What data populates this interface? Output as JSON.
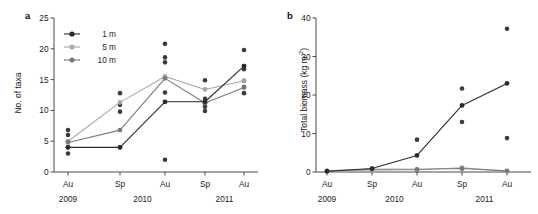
{
  "figure": {
    "panel_a_label": "a",
    "panel_b_label": "b"
  },
  "series_styles": {
    "1m": "#2b2b2b",
    "5m": "#a8a8a8",
    "10m": "#7a7a7a"
  },
  "legend": {
    "items": [
      {
        "label": "1 m",
        "color": "#2b2b2b"
      },
      {
        "label": "5 m",
        "color": "#a8a8a8"
      },
      {
        "label": "10 m",
        "color": "#7a7a7a"
      }
    ]
  },
  "chart_data": [
    {
      "type": "line",
      "panel": "a",
      "title": "",
      "xlabel": "",
      "ylabel": "No. of taxa",
      "ylim": [
        0,
        25
      ],
      "yticks": [
        0,
        5,
        10,
        15,
        20,
        25
      ],
      "ytick_labels": [
        "0",
        "5",
        "10",
        "15",
        "20",
        "25"
      ],
      "grid": false,
      "legend_position": "top-left",
      "categories": [
        "Au",
        "Sp",
        "Au",
        "Sp",
        "Au"
      ],
      "x_group_labels": [
        {
          "label": "2009",
          "spans": [
            0
          ]
        },
        {
          "label": "2010",
          "spans": [
            1,
            2
          ]
        },
        {
          "label": "2011",
          "spans": [
            3,
            4
          ]
        }
      ],
      "series": [
        {
          "name": "1 m",
          "color": "#2b2b2b",
          "values": [
            4.0,
            4.0,
            11.4,
            11.4,
            17.2
          ]
        },
        {
          "name": "5 m",
          "color": "#a8a8a8",
          "values": [
            5.0,
            11.3,
            15.5,
            13.4,
            14.8
          ]
        },
        {
          "name": "10 m",
          "color": "#7a7a7a",
          "values": [
            4.8,
            6.8,
            15.2,
            11.2,
            13.7
          ]
        }
      ],
      "scatter_points": [
        {
          "x_index": 0,
          "values": [
            3.0,
            4.0,
            5.0,
            6.0,
            6.8
          ],
          "color": "#3b3b3b"
        },
        {
          "x_index": 1,
          "values": [
            4.0,
            9.8,
            10.9,
            12.8
          ],
          "color": "#3b3b3b"
        },
        {
          "x_index": 2,
          "values": [
            2.0,
            12.9,
            15.3,
            17.8,
            18.6,
            20.8
          ],
          "color": "#3b3b3b"
        },
        {
          "x_index": 3,
          "values": [
            9.9,
            10.6,
            11.1,
            11.4,
            11.9,
            14.9
          ],
          "color": "#3b3b3b"
        },
        {
          "x_index": 4,
          "values": [
            12.8,
            13.8,
            14.8,
            16.7,
            17.2,
            19.8
          ],
          "color": "#3b3b3b"
        }
      ]
    },
    {
      "type": "line",
      "panel": "b",
      "title": "",
      "xlabel": "",
      "ylabel": "Total biomass (kg m-2)",
      "ylabel_base": "Total biomass (kg m",
      "ylabel_sup": "-2",
      "ylabel_tail": ")",
      "ylim": [
        0,
        40
      ],
      "yticks": [
        0,
        10,
        20,
        30,
        40
      ],
      "ytick_labels": [
        "0",
        "10",
        "20",
        "30",
        "40"
      ],
      "grid": false,
      "legend_position": "none",
      "categories": [
        "Au",
        "Sp",
        "Au",
        "Sp",
        "Au"
      ],
      "x_group_labels": [
        {
          "label": "2009",
          "spans": [
            0
          ]
        },
        {
          "label": "2010",
          "spans": [
            1,
            2
          ]
        },
        {
          "label": "2011",
          "spans": [
            3,
            4
          ]
        }
      ],
      "series": [
        {
          "name": "1 m",
          "color": "#2b2b2b",
          "values": [
            0.2,
            0.9,
            4.3,
            17.3,
            23.0
          ]
        },
        {
          "name": "5 m",
          "color": "#a8a8a8",
          "values": [
            0.2,
            0.5,
            0.6,
            1.1,
            0.2
          ]
        },
        {
          "name": "10 m",
          "color": "#7a7a7a",
          "values": [
            0.3,
            0.7,
            0.7,
            0.9,
            0.3
          ]
        }
      ],
      "scatter_points": [
        {
          "x_index": 0,
          "values": [
            0.2
          ],
          "color": "#3b3b3b"
        },
        {
          "x_index": 1,
          "values": [
            0.8
          ],
          "color": "#3b3b3b"
        },
        {
          "x_index": 2,
          "values": [
            0.5,
            8.4
          ],
          "color": "#3b3b3b"
        },
        {
          "x_index": 3,
          "values": [
            0.9,
            13.0,
            21.7
          ],
          "color": "#3b3b3b"
        },
        {
          "x_index": 4,
          "values": [
            0.2,
            8.8,
            37.2
          ],
          "color": "#3b3b3b"
        }
      ]
    }
  ]
}
